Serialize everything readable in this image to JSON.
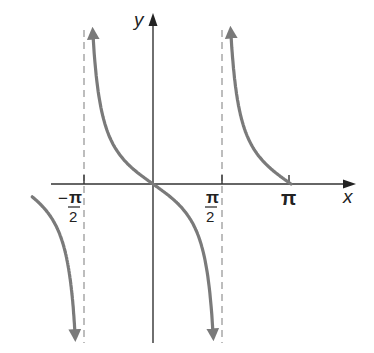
{
  "chart_data": {
    "type": "line",
    "title": "",
    "function": "y = -tan(x)",
    "xlabel": "x",
    "ylabel": "y",
    "x_ticks": [
      {
        "value": -1.5708,
        "label_num": "π",
        "label_den": "2",
        "sign": "−"
      },
      {
        "value": 1.5708,
        "label_num": "π",
        "label_den": "2",
        "sign": ""
      },
      {
        "value": 3.1416,
        "label": "π"
      }
    ],
    "asymptotes": [
      -1.5708,
      1.5708
    ],
    "xlim": [
      -2.75,
      3.1416
    ],
    "series": [
      {
        "name": "branch-left",
        "x_range": [
          -2.75,
          -1.62
        ],
        "behavior": "decreasing from about -0.4 toward -∞"
      },
      {
        "name": "branch-center",
        "x_range": [
          -1.52,
          1.52
        ],
        "behavior": "decreasing from +∞ through origin to -∞"
      },
      {
        "name": "branch-right",
        "x_range": [
          1.62,
          3.1416
        ],
        "behavior": "decreasing from +∞ to 0 at π"
      }
    ],
    "grid": false,
    "legend": null
  },
  "labels": {
    "x_axis": "x",
    "y_axis": "y",
    "neg_half_pi_sign": "−",
    "pi": "π",
    "two": "2"
  },
  "colors": {
    "curve": "#7a7a7a",
    "axis": "#333333",
    "asymptote": "#9a9a9a"
  }
}
